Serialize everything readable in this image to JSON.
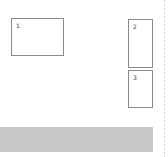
{
  "panels": [
    {
      "label": "1"
    },
    {
      "label": "2"
    },
    {
      "label": "3"
    }
  ],
  "colors": {
    "border": "#8a8a8a",
    "bar": "#c8c8c8"
  }
}
